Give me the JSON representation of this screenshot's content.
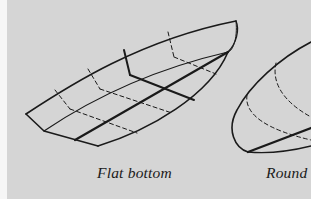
{
  "figure": {
    "background_color": "#d5d5d5",
    "line_color": "#1a1a1a",
    "captions": {
      "flat": "Flat bottom",
      "round": "Round"
    },
    "illustrations": [
      {
        "name": "flat-bottom-hull",
        "caption_key": "flat"
      },
      {
        "name": "round-bottom-hull",
        "caption_key": "round",
        "cropped": true
      }
    ]
  }
}
